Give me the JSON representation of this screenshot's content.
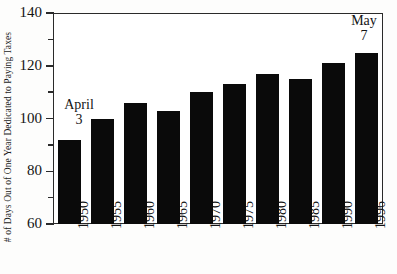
{
  "chart_data": {
    "type": "bar",
    "title": "",
    "subtitle": "",
    "xlabel": "",
    "ylabel": "# of Days Out of One Year Dedicated to Paying Taxes",
    "categories": [
      "1950",
      "1955",
      "1960",
      "1965",
      "1970",
      "1975",
      "1980",
      "1985",
      "1990",
      "1996"
    ],
    "values": [
      92,
      100,
      106,
      103,
      110,
      113,
      117,
      115,
      121,
      125
    ],
    "series": [
      {
        "name": "Days dedicated to paying taxes",
        "values": [
          92,
          100,
          106,
          103,
          110,
          113,
          117,
          115,
          121,
          125
        ]
      }
    ],
    "ylim": [
      60,
      140
    ],
    "y_major_ticks": [
      60,
      80,
      100,
      120,
      140
    ],
    "y_minor_ticks": [
      70,
      90,
      110,
      130
    ],
    "y_tick_labels": [
      "60",
      "80",
      "100",
      "120",
      "140"
    ],
    "grid": false,
    "legend": false,
    "legend_position": "none",
    "bar_color": "#0a0a0a",
    "frame_color": "#2a2a2a",
    "background_color": "#ffffff",
    "annotations": [
      {
        "id": "start",
        "line1": "April",
        "line2": "3",
        "attached_to_category": "1950",
        "note": "Tax freedom day for first bar"
      },
      {
        "id": "end",
        "line1": "May",
        "line2": "7",
        "attached_to_category": "1996",
        "note": "Tax freedom day for last bar"
      }
    ]
  }
}
